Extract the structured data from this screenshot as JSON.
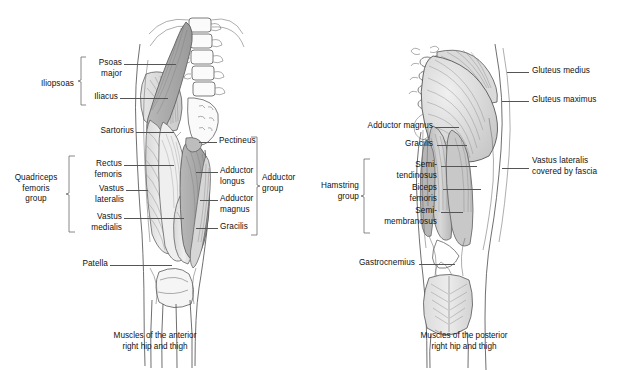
{
  "figures": [
    {
      "id": "anterior",
      "caption": "Muscles of the anterior\nright hip and thigh",
      "group_labels": [
        {
          "name": "iliopsoas",
          "text": "Iliopsoas"
        },
        {
          "name": "quadriceps-femoris-group",
          "text": "Quadriceps\nfemoris\ngroup"
        },
        {
          "name": "adductor-group",
          "text": "Adductor\ngroup"
        }
      ],
      "labels": [
        {
          "name": "psoas-major",
          "text": "Psoas\nmajor"
        },
        {
          "name": "iliacus",
          "text": "Iliacus"
        },
        {
          "name": "sartorius",
          "text": "Sartorius"
        },
        {
          "name": "rectus-femoris",
          "text": "Rectus\nfemoris"
        },
        {
          "name": "vastus-lateralis",
          "text": "Vastus\nlateralis"
        },
        {
          "name": "vastus-medialis",
          "text": "Vastus\nmedialis"
        },
        {
          "name": "patella",
          "text": "Patella"
        },
        {
          "name": "pectineus",
          "text": "Pectineus"
        },
        {
          "name": "adductor-longus",
          "text": "Adductor\nlongus"
        },
        {
          "name": "adductor-magnus",
          "text": "Adductor\nmagnus"
        },
        {
          "name": "gracilis",
          "text": "Gracilis"
        }
      ]
    },
    {
      "id": "posterior",
      "caption": "Muscles of the posterior\nright hip and thigh",
      "group_labels": [
        {
          "name": "hamstring-group",
          "text": "Hamstring\ngroup"
        }
      ],
      "labels": [
        {
          "name": "gluteus-medius",
          "text": "Gluteus medius"
        },
        {
          "name": "gluteus-maximus",
          "text": "Gluteus maximus"
        },
        {
          "name": "adductor-magnus",
          "text": "Adductor magnus"
        },
        {
          "name": "gracilis",
          "text": "Gracilis"
        },
        {
          "name": "semitendinosus",
          "text": "Semi-\ntendinosus"
        },
        {
          "name": "biceps-femoris",
          "text": "Biceps\nfemoris"
        },
        {
          "name": "semimembranosus",
          "text": "Semi-\nmembranosus"
        },
        {
          "name": "gastrocnemius",
          "text": "Gastrocnemius"
        },
        {
          "name": "vastus-lateralis-fascia",
          "text": "Vastus lateralis\ncovered by fascia"
        }
      ]
    }
  ],
  "colors": {
    "background": "#ffffff",
    "ink": "#1a1a1a",
    "leader": "#555555",
    "outline": "#4a4a4a",
    "muscle_light": "#e9e9e9",
    "muscle_mid": "#cfcfcf",
    "muscle_dark": "#a9a9a9"
  }
}
